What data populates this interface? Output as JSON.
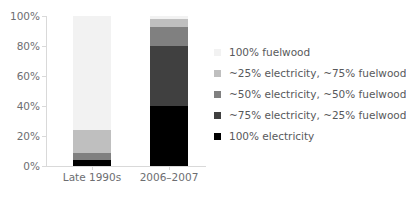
{
  "chart_data": {
    "type": "bar",
    "stacked": true,
    "title": "",
    "xlabel": "",
    "ylabel": "",
    "categories": [
      "Late 1990s",
      "2006–2007"
    ],
    "ylim": [
      0,
      100
    ],
    "ytick_labels": [
      "0%",
      "20%",
      "40%",
      "60%",
      "80%",
      "100%"
    ],
    "ytick_values": [
      0,
      20,
      40,
      60,
      80,
      100
    ],
    "grid": false,
    "legend_position": "right",
    "series": [
      {
        "name": "100% fuelwood",
        "color": "#f2f2f2",
        "values": [
          76,
          2
        ]
      },
      {
        "name": "~25% electricity, ~75% fuelwood",
        "color": "#bfbfbf",
        "values": [
          15,
          5
        ]
      },
      {
        "name": "~50% electricity, ~50% fuelwood",
        "color": "#808080",
        "values": [
          5,
          13
        ]
      },
      {
        "name": "~75% electricity, ~25% fuelwood",
        "color": "#404040",
        "values": [
          0,
          40
        ]
      },
      {
        "name": "100% electricity",
        "color": "#000000",
        "values": [
          4,
          40
        ]
      }
    ]
  },
  "axis": {
    "axis_color": "#d9d9d9",
    "tick_label_color": "#6d6e71"
  },
  "legend": {
    "items": [
      {
        "label": "100% fuelwood",
        "color": "#f2f2f2"
      },
      {
        "label": "~25% electricity, ~75% fuelwood",
        "color": "#bfbfbf"
      },
      {
        "label": "~50% electricity, ~50% fuelwood",
        "color": "#808080"
      },
      {
        "label": "~75% electricity, ~25% fuelwood",
        "color": "#404040"
      },
      {
        "label": "100% electricity",
        "color": "#000000"
      }
    ]
  }
}
